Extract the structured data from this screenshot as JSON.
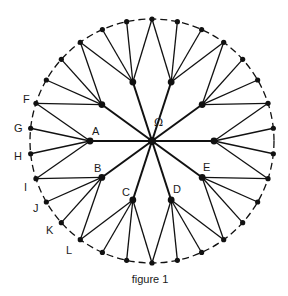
{
  "figure": {
    "caption": "figure 1",
    "center_label": "Ω",
    "colors": {
      "ink": "#111111",
      "background": "#ffffff"
    },
    "geometry": {
      "center": [
        152,
        141
      ],
      "perimeter_radius": 122,
      "hub_radius": 62,
      "hub_count": 10,
      "hub_start_angle_deg": 0,
      "perimeter_dot_count": 30,
      "perimeter_start_angle_deg": 6,
      "perimeter_style": "dashed circle"
    },
    "hub_labels": [
      {
        "text": "A",
        "x": 92,
        "y": 135
      },
      {
        "text": "B",
        "x": 94,
        "y": 172
      },
      {
        "text": "C",
        "x": 122,
        "y": 196
      },
      {
        "text": "D",
        "x": 173,
        "y": 193
      },
      {
        "text": "E",
        "x": 203,
        "y": 171
      }
    ],
    "perimeter_labels": [
      {
        "text": "F",
        "x": 23,
        "y": 103
      },
      {
        "text": "G",
        "x": 14,
        "y": 132
      },
      {
        "text": "H",
        "x": 14,
        "y": 160
      },
      {
        "text": "I",
        "x": 24,
        "y": 191
      },
      {
        "text": "J",
        "x": 33,
        "y": 212
      },
      {
        "text": "K",
        "x": 46,
        "y": 234
      },
      {
        "text": "L",
        "x": 66,
        "y": 254
      }
    ],
    "omega_position": {
      "x": 154,
      "y": 126
    },
    "caption_position": {
      "x": 150,
      "y": 283
    }
  }
}
